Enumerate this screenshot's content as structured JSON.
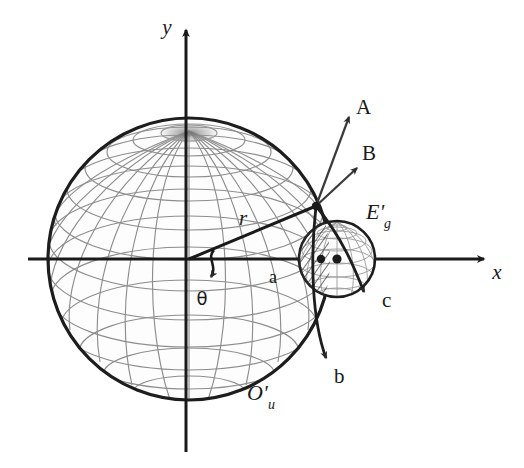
{
  "figure": {
    "type": "geometry-diagram",
    "background_color": "#ffffff",
    "ink_color": "#1a1a1a",
    "mesh_color": "#8a8a8a"
  },
  "axes": {
    "x_label": "x",
    "y_label": "y",
    "origin_x": 189,
    "origin_y": 259,
    "x_axis_start_x": 28,
    "x_axis_end_x": 492,
    "y_axis_top_y": 22,
    "y_axis_bottom_y": 452
  },
  "spheres": {
    "large": {
      "label": "O'",
      "label_sub": "u",
      "center_x": 189,
      "center_y": 259,
      "radius": 141,
      "label_x": 247,
      "label_y": 400
    },
    "small": {
      "label": "E'",
      "label_sub": "g",
      "center_x": 337,
      "center_y": 259,
      "radius": 38,
      "label_x": 366,
      "label_y": 219
    }
  },
  "radius_line": {
    "label": "r",
    "label_x": 243,
    "label_y": 225,
    "from_x": 189,
    "from_y": 259,
    "to_x": 316,
    "to_y": 206
  },
  "angle": {
    "label": "θ",
    "label_x": 202,
    "label_y": 305
  },
  "vectors": [
    {
      "name": "A",
      "label": "A",
      "from_x": 316,
      "from_y": 206,
      "to_x": 349,
      "to_y": 117,
      "label_x": 356,
      "label_y": 114
    },
    {
      "name": "B",
      "label": "B",
      "from_x": 316,
      "from_y": 206,
      "to_x": 357,
      "to_y": 168,
      "label_x": 362,
      "label_y": 160
    },
    {
      "name": "b",
      "label": "b",
      "from_x": 316,
      "from_y": 206,
      "to_x": 328,
      "to_y": 364,
      "label_x": 334,
      "label_y": 383
    },
    {
      "name": "c",
      "label": "c",
      "from_x": 316,
      "from_y": 206,
      "to_x": 370,
      "to_y": 297,
      "label_x": 382,
      "label_y": 307
    }
  ],
  "points": [
    {
      "name": "a",
      "label": "a",
      "label_x": 269,
      "label_y": 283,
      "dot_x": 321,
      "dot_y": 259
    },
    {
      "name": "small-sphere-center",
      "label": "",
      "dot_x": 337,
      "dot_y": 259
    }
  ],
  "hatched_region": {
    "name": "lens-intersection",
    "description": "hatched lens between the two spheres"
  }
}
